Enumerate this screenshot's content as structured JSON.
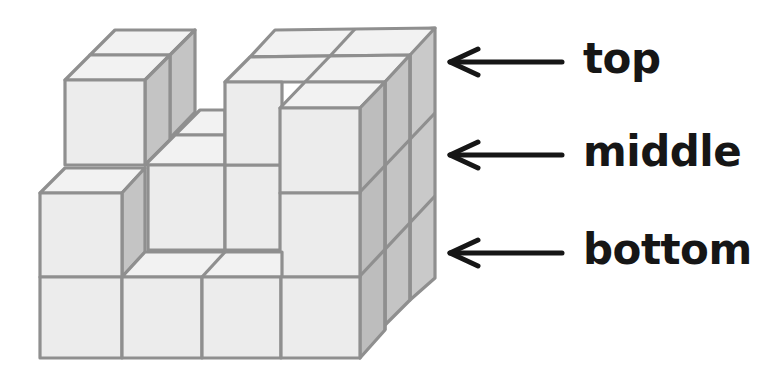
{
  "diagram": {
    "labels": [
      {
        "text": "top",
        "y": 62
      },
      {
        "text": "middle",
        "y": 155
      },
      {
        "text": "bottom",
        "y": 253
      }
    ],
    "colors": {
      "front_face": "#ececec",
      "top_face": "#f2f2f2",
      "side_face": "#c4c4c4",
      "edge": "#8f8f8f",
      "arrow": "#161616",
      "text": "#161616"
    }
  }
}
